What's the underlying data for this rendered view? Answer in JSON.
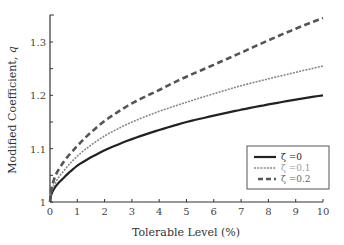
{
  "chart_data": {
    "type": "line",
    "title": "",
    "xlabel": "Tolerable Level (%)",
    "ylabel": "Modified Coefficient, q",
    "xlim": [
      0,
      10
    ],
    "ylim": [
      1.0,
      1.35
    ],
    "xticks": [
      0,
      1,
      2,
      3,
      4,
      5,
      6,
      7,
      8,
      9,
      10
    ],
    "yticks_labeled": [
      1,
      1.1,
      1.2,
      1.3
    ],
    "yticks_minor": [
      1.05,
      1.15,
      1.25
    ],
    "ytick_labels": [
      "1",
      "1.1",
      "1.2",
      "1.3"
    ],
    "grid": false,
    "legend_position": "lower right",
    "x": [
      0,
      0.25,
      0.5,
      1,
      2,
      3,
      4,
      5,
      6,
      7,
      8,
      9,
      10
    ],
    "series": [
      {
        "name": "ζ =0",
        "style": "solid",
        "color": "#222222",
        "values": [
          1.0,
          1.032,
          1.045,
          1.068,
          1.097,
          1.118,
          1.135,
          1.15,
          1.162,
          1.173,
          1.183,
          1.192,
          1.2
        ]
      },
      {
        "name": "ζ =0.1",
        "style": "dotted",
        "color": "#888888",
        "values": [
          1.0,
          1.041,
          1.058,
          1.086,
          1.124,
          1.15,
          1.17,
          1.187,
          1.203,
          1.218,
          1.231,
          1.243,
          1.255
        ]
      },
      {
        "name": "ζ =0.2",
        "style": "dashed",
        "color": "#555555",
        "values": [
          1.0,
          1.055,
          1.075,
          1.105,
          1.152,
          1.185,
          1.21,
          1.235,
          1.257,
          1.28,
          1.303,
          1.325,
          1.345
        ]
      }
    ]
  },
  "labels": {
    "xlabel": "Tolerable Level (%)",
    "ylabel_main": "Modified Coefficient, ",
    "ylabel_var": "q"
  },
  "legend": [
    {
      "label": "ζ =0"
    },
    {
      "label": "ζ =0.1"
    },
    {
      "label": "ζ =0.2"
    }
  ]
}
